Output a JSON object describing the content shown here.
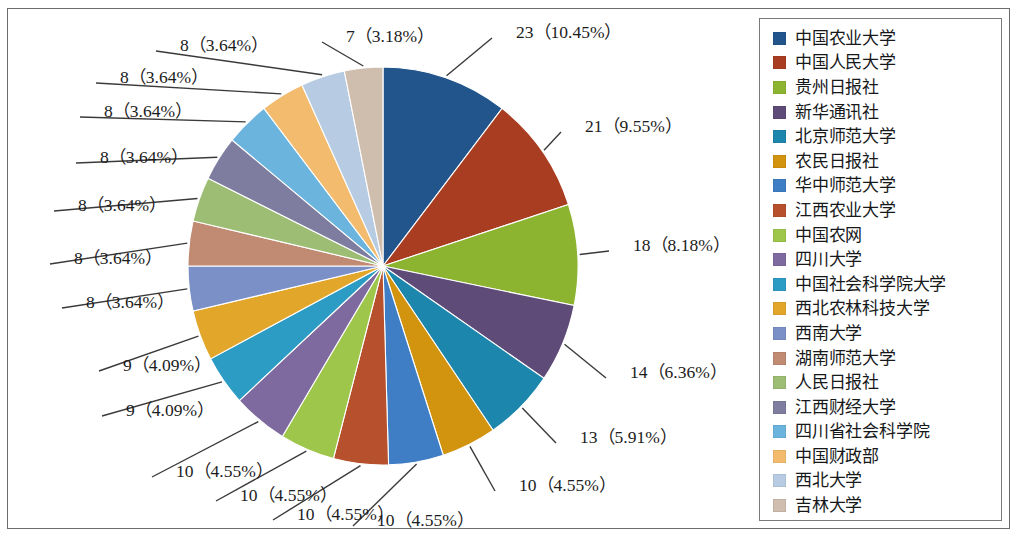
{
  "chart_data": {
    "type": "pie",
    "title": "",
    "total": 220,
    "legend_position": "right",
    "start_angle_deg": 0,
    "direction": "clockwise",
    "categories": [
      "中国农业大学",
      "中国人民大学",
      "贵州日报社",
      "新华通讯社",
      "北京师范大学",
      "农民日报社",
      "华中师范大学",
      "江西农业大学",
      "中国农网",
      "四川大学",
      "中国社会科学院大学",
      "西北农林科技大学",
      "西南大学",
      "湖南师范大学",
      "人民日报社",
      "江西财经大学",
      "四川省社会科学院",
      "中国财政部",
      "西北大学",
      "吉林大学"
    ],
    "values": [
      23,
      21,
      18,
      14,
      13,
      10,
      10,
      10,
      10,
      10,
      9,
      9,
      8,
      8,
      8,
      8,
      8,
      8,
      8,
      7
    ],
    "percents": [
      "10.45%",
      "9.55%",
      "8.18%",
      "6.36%",
      "5.91%",
      "4.55%",
      "4.55%",
      "4.55%",
      "4.55%",
      "4.55%",
      "4.09%",
      "4.09%",
      "3.64%",
      "3.64%",
      "3.64%",
      "3.64%",
      "3.64%",
      "3.64%",
      "3.64%",
      "3.18%"
    ],
    "colors": [
      "#21558c",
      "#a93d21",
      "#8cb430",
      "#5f4b78",
      "#1d86ad",
      "#d2930f",
      "#3f7ec4",
      "#b7502c",
      "#9ec64a",
      "#7e6a9e",
      "#2d9cc4",
      "#e2a62b",
      "#7b90c6",
      "#c08a73",
      "#9dbd74",
      "#7e7da0",
      "#6bb4de",
      "#f2bb6e",
      "#b7cce2",
      "#cfbdae"
    ],
    "labels": [
      {
        "id": "slice-label-1",
        "text": "23（10.45%）"
      },
      {
        "id": "slice-label-2",
        "text": "21（9.55%）"
      },
      {
        "id": "slice-label-3",
        "text": "18（8.18%）"
      },
      {
        "id": "slice-label-4",
        "text": "14（6.36%）"
      },
      {
        "id": "slice-label-5",
        "text": "13（5.91%）"
      },
      {
        "id": "slice-label-6",
        "text": "10（4.55%）"
      },
      {
        "id": "slice-label-7",
        "text": "10（4.55%）"
      },
      {
        "id": "slice-label-8",
        "text": "10（4.55%）"
      },
      {
        "id": "slice-label-9",
        "text": "10（4.55%）"
      },
      {
        "id": "slice-label-10",
        "text": "10（4.55%）"
      },
      {
        "id": "slice-label-11",
        "text": "9（4.09%）"
      },
      {
        "id": "slice-label-12",
        "text": "9（4.09%）"
      },
      {
        "id": "slice-label-13",
        "text": "8（3.64%）"
      },
      {
        "id": "slice-label-14",
        "text": "8（3.64%）"
      },
      {
        "id": "slice-label-15",
        "text": "8（3.64%）"
      },
      {
        "id": "slice-label-16",
        "text": "8（3.64%）"
      },
      {
        "id": "slice-label-17",
        "text": "8（3.64%）"
      },
      {
        "id": "slice-label-18",
        "text": "8（3.64%）"
      },
      {
        "id": "slice-label-19",
        "text": "8（3.64%）"
      },
      {
        "id": "slice-label-20",
        "text": "7（3.18%）"
      }
    ],
    "label_positions": [
      {
        "x": 516,
        "y": 18,
        "anchor": "start",
        "lx": 492,
        "ly": 38,
        "px": null
      },
      {
        "x": 585,
        "y": 112,
        "anchor": "start",
        "lx": 561,
        "ly": 132,
        "px": null
      },
      {
        "x": 633,
        "y": 231,
        "anchor": "start",
        "lx": 609,
        "ly": 251,
        "px": null
      },
      {
        "x": 630,
        "y": 358,
        "anchor": "start",
        "lx": 606,
        "ly": 378,
        "px": null
      },
      {
        "x": 580,
        "y": 423,
        "anchor": "start",
        "lx": 556,
        "ly": 443,
        "px": null
      },
      {
        "x": 519,
        "y": 471,
        "anchor": "start",
        "lx": 495,
        "ly": 491,
        "px": null
      },
      {
        "x": 377,
        "y": 506,
        "anchor": "start",
        "lx": 353,
        "ly": 526,
        "px": null
      },
      {
        "x": 297,
        "y": 500,
        "anchor": "start",
        "lx": 273,
        "ly": 520,
        "px": null
      },
      {
        "x": 240,
        "y": 481,
        "anchor": "start",
        "lx": 216,
        "ly": 501,
        "px": null
      },
      {
        "x": 176,
        "y": 457,
        "anchor": "start",
        "lx": 152,
        "ly": 477,
        "px": null
      },
      {
        "x": 126,
        "y": 396,
        "anchor": "start",
        "lx": 102,
        "ly": 416,
        "px": null
      },
      {
        "x": 123,
        "y": 351,
        "anchor": "start",
        "lx": 99,
        "ly": 371,
        "px": null
      },
      {
        "x": 86,
        "y": 288,
        "anchor": "start",
        "lx": 62,
        "ly": 308,
        "px": null
      },
      {
        "x": 74,
        "y": 244,
        "anchor": "start",
        "lx": 50,
        "ly": 264,
        "px": null
      },
      {
        "x": 78,
        "y": 191,
        "anchor": "start",
        "lx": 54,
        "ly": 211,
        "px": null
      },
      {
        "x": 100,
        "y": 143,
        "anchor": "start",
        "lx": 76,
        "ly": 163,
        "px": null
      },
      {
        "x": 104,
        "y": 97,
        "anchor": "start",
        "lx": 80,
        "ly": 117,
        "px": null
      },
      {
        "x": 120,
        "y": 63,
        "anchor": "start",
        "lx": 96,
        "ly": 83,
        "px": null
      },
      {
        "x": 180,
        "y": 31,
        "anchor": "start",
        "lx": 156,
        "ly": 51,
        "px": null
      },
      {
        "x": 346,
        "y": 22,
        "anchor": "start",
        "lx": 322,
        "ly": 42,
        "px": null
      }
    ],
    "geometry": {
      "cx": 383,
      "cy": 266,
      "rx": 195,
      "ry": 199
    }
  }
}
